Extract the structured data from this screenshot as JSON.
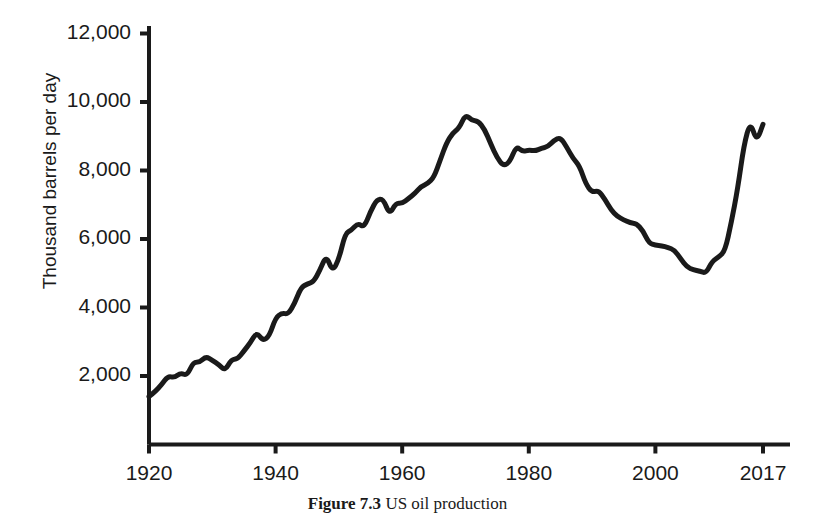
{
  "figure": {
    "caption_label": "Figure 7.3",
    "caption_text": "US oil production"
  },
  "axes": {
    "y_axis_title": "Thousand barrels per day",
    "y_tick_labels": [
      "12,000",
      "10,000",
      "8,000",
      "6,000",
      "4,000",
      "2,000"
    ],
    "x_tick_labels": [
      "1920",
      "1940",
      "1960",
      "1980",
      "2000",
      "2017"
    ]
  },
  "chart_data": {
    "type": "line",
    "title": "US oil production",
    "xlabel": "",
    "ylabel": "Thousand barrels per day",
    "xlim": [
      1920,
      2017
    ],
    "ylim": [
      0,
      12000
    ],
    "yticks": [
      2000,
      4000,
      6000,
      8000,
      10000,
      12000
    ],
    "xticks": [
      1920,
      1940,
      1960,
      1980,
      2000,
      2017
    ],
    "grid": false,
    "legend": "none",
    "line_color": "#1a1a1a",
    "line_width": 5,
    "units": "thousand barrels per day",
    "series": [
      {
        "name": "US oil production",
        "x": [
          1920,
          1921,
          1922,
          1923,
          1924,
          1925,
          1926,
          1927,
          1928,
          1929,
          1930,
          1931,
          1932,
          1933,
          1934,
          1935,
          1936,
          1937,
          1938,
          1939,
          1940,
          1941,
          1942,
          1943,
          1944,
          1945,
          1946,
          1947,
          1948,
          1949,
          1950,
          1951,
          1952,
          1953,
          1954,
          1955,
          1956,
          1957,
          1958,
          1959,
          1960,
          1961,
          1962,
          1963,
          1964,
          1965,
          1966,
          1967,
          1968,
          1969,
          1970,
          1971,
          1972,
          1973,
          1974,
          1975,
          1976,
          1977,
          1978,
          1979,
          1980,
          1981,
          1982,
          1983,
          1984,
          1985,
          1986,
          1987,
          1988,
          1989,
          1990,
          1991,
          1992,
          1993,
          1994,
          1995,
          1996,
          1997,
          1998,
          1999,
          2000,
          2001,
          2002,
          2003,
          2004,
          2005,
          2006,
          2007,
          2008,
          2009,
          2010,
          2011,
          2012,
          2013,
          2014,
          2015,
          2016,
          2017
        ],
        "values": [
          1400,
          1550,
          1750,
          2000,
          1950,
          2090,
          2010,
          2400,
          2400,
          2570,
          2460,
          2340,
          2150,
          2480,
          2500,
          2730,
          2970,
          3280,
          3030,
          3160,
          3700,
          3840,
          3800,
          4120,
          4580,
          4690,
          4750,
          5090,
          5520,
          5050,
          5410,
          6160,
          6260,
          6460,
          6340,
          6810,
          7150,
          7170,
          6710,
          7050,
          7040,
          7180,
          7330,
          7540,
          7610,
          7800,
          8300,
          8810,
          9100,
          9240,
          9640,
          9460,
          9440,
          9210,
          8770,
          8370,
          8130,
          8250,
          8710,
          8550,
          8600,
          8570,
          8650,
          8690,
          8880,
          8970,
          8680,
          8350,
          8140,
          7610,
          7360,
          7420,
          7170,
          6850,
          6660,
          6560,
          6470,
          6450,
          6250,
          5880,
          5820,
          5800,
          5750,
          5680,
          5420,
          5180,
          5100,
          5060,
          5000,
          5360,
          5470,
          5650,
          6490,
          7470,
          8760,
          9430,
          8840,
          9350
        ]
      }
    ],
    "annotations": [
      {
        "label": "1970 peak",
        "x": 1970,
        "y": 9640
      },
      {
        "label": "1985 secondary peak",
        "x": 1985,
        "y": 8970
      },
      {
        "label": "2008 trough",
        "x": 2008,
        "y": 5000
      },
      {
        "label": "2015 shale peak",
        "x": 2015,
        "y": 9430
      }
    ]
  }
}
